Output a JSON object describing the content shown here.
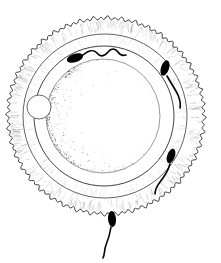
{
  "figure": {
    "title": "Ovum surrounded by corona radiata with spermatozoa",
    "caption": "",
    "background_color": "#ffffff",
    "ink_color": "#000000",
    "shade_color": "#8a8a8a",
    "width": 221,
    "height": 263
  },
  "structures": {
    "corona_radiata": {
      "label": "corona radiata",
      "center_x": 106,
      "center_y": 116,
      "radius": 98,
      "scallop_count": 88,
      "scallop_depth": 3,
      "stroke_color": "#2b2b2b",
      "stroke_width": 0.9,
      "fill_color": "#ffffff"
    },
    "corona_inner_edge": {
      "label": "corona radiata inner boundary",
      "center_x": 105,
      "center_y": 116,
      "radius": 82,
      "stroke_color": "#3a3a3a",
      "stroke_width": 0.8
    },
    "zona_pellucida": {
      "label": "zona pellucida",
      "center_x": 104,
      "center_y": 116,
      "radius": 70,
      "stroke_color": "#2b2b2b",
      "stroke_width": 0.9,
      "fill_color": "#ffffff"
    },
    "ovum": {
      "label": "ovum",
      "center_x": 103,
      "center_y": 116,
      "radius": 57,
      "stroke_color": "#707070",
      "stroke_width": 0.7,
      "fill_color": "#ffffff"
    },
    "polar_body": {
      "label": "polar body",
      "center_x": 39,
      "center_y": 107,
      "radius": 12,
      "stroke_color": "#5a5a5a",
      "stroke_width": 0.9,
      "fill_color": "#ffffff"
    }
  },
  "sperm_cells": [
    {
      "name": "sperm-top",
      "label": "spermatozoon at upper left of zona pellucida",
      "head_cx": 75,
      "head_cy": 58,
      "head_rx": 8.5,
      "head_ry": 4.2,
      "head_rotation": -18,
      "tail_path": "M 83 55 C 89 50 93 49 97 53 C 100 57 104 57 108 52 C 111 48 115 48 118 52 C 120 55 123 56 126 55",
      "tail_width": 1.6,
      "color": "#000000"
    },
    {
      "name": "sperm-upper-right",
      "label": "spermatozoon at upper right of zona pellucida",
      "head_cx": 165,
      "head_cy": 68,
      "head_rx": 4.0,
      "head_ry": 8.0,
      "head_rotation": 18,
      "tail_path": "M 167 76 C 171 83 175 89 178 95 C 180 100 181 104 180 108",
      "tail_width": 1.6,
      "color": "#000000"
    },
    {
      "name": "sperm-lower-right",
      "label": "spermatozoon at lower right of zona pellucida",
      "head_cx": 171,
      "head_cy": 156,
      "head_rx": 3.8,
      "head_ry": 7.5,
      "head_rotation": 20,
      "tail_path": "M 170 164 C 168 171 164 177 160 182 C 157 186 155 190 155 194",
      "tail_width": 1.6,
      "color": "#000000"
    },
    {
      "name": "sperm-bottom",
      "label": "spermatozoon at bottom of zona pellucida",
      "head_cx": 112,
      "head_cy": 219,
      "head_rx": 4.0,
      "head_ry": 8.0,
      "head_rotation": -4,
      "tail_path": "M 111 227 C 110 234 108 240 106 245 C 104 250 105 254 103 258",
      "tail_width": 1.6,
      "color": "#000000"
    }
  ],
  "shading": {
    "corona_radial_streaks": {
      "label": "radial stipple streaks in corona radiata",
      "count": 150,
      "color": "#9b9b9b"
    },
    "ovum_stipple": {
      "label": "stippled shading along lower-left of ovum",
      "count": 900,
      "color": "#6f6f6f"
    }
  }
}
